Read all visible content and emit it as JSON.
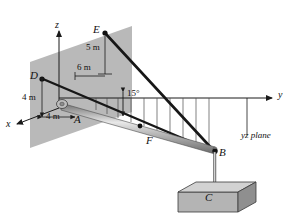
{
  "figure": {
    "background": "#ffffff",
    "wall_color": "#b9b9b9",
    "line_color": "#1a1a1a",
    "thin_line_color": "#555555",
    "boom_color": "#9a9a9a",
    "crate_color": "#b0b0b0"
  },
  "axes": {
    "z_label": "z",
    "y_label": "y",
    "x_label": "x"
  },
  "points": {
    "A": "A",
    "B": "B",
    "C": "C",
    "D": "D",
    "E": "E",
    "F": "F"
  },
  "dimensions": {
    "d_vertical": "4 m",
    "d_horizontal": "4 m",
    "e_vertical": "5 m",
    "e_horizontal": "6 m"
  },
  "angles": {
    "boom_angle": "15°"
  },
  "annotations": {
    "plane_label": "yz plane"
  }
}
